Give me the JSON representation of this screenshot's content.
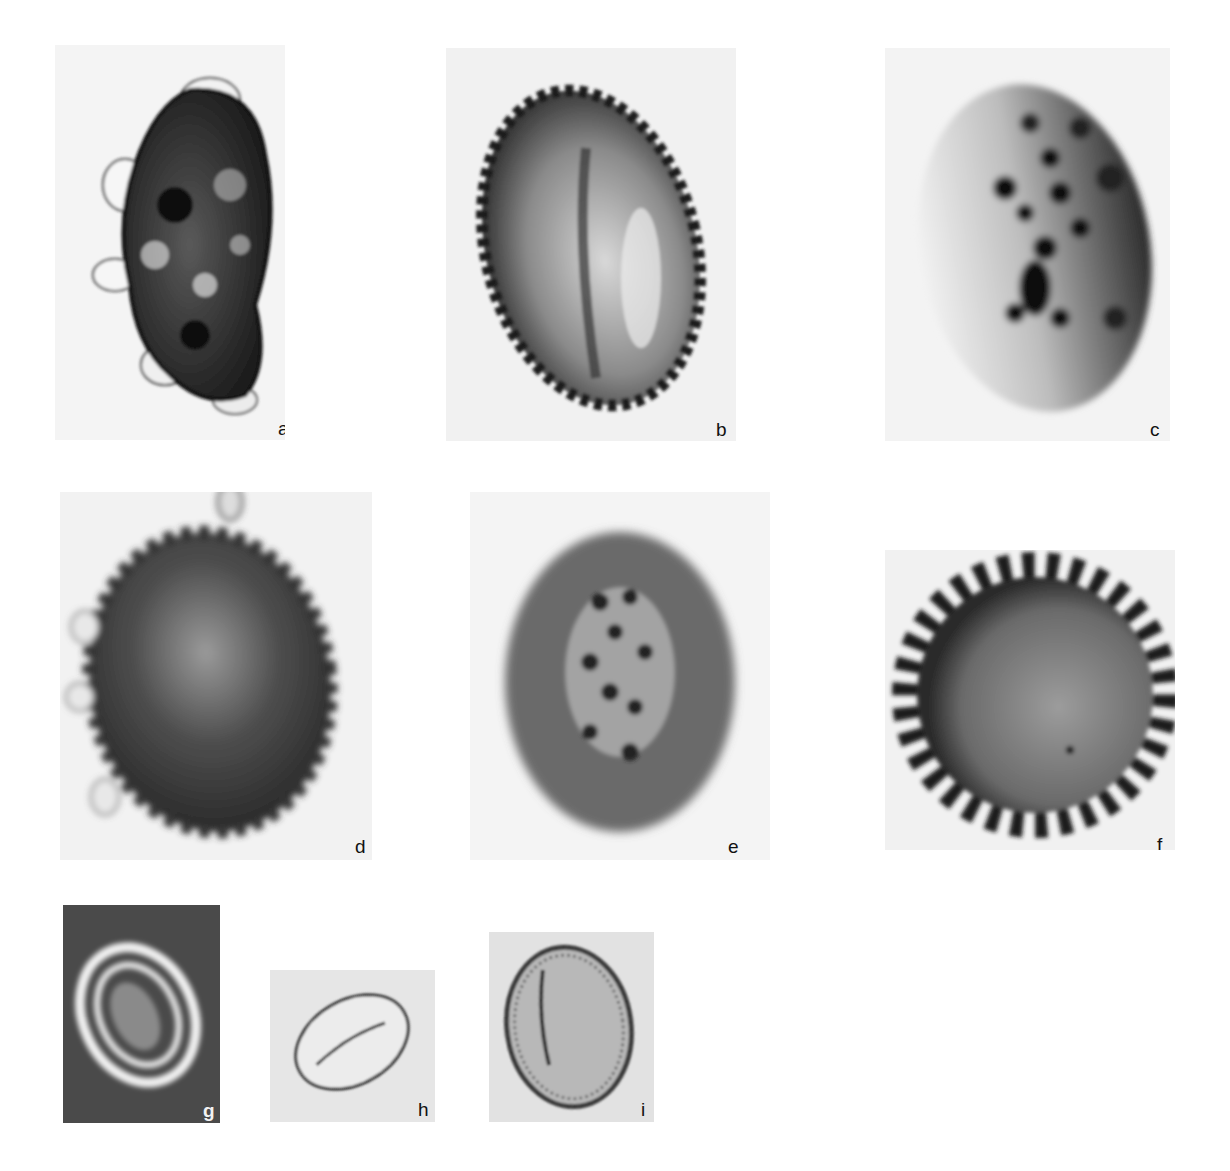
{
  "figure": {
    "type": "micrograph plate",
    "panels": [
      {
        "id": "a",
        "label": "a",
        "description": "irregular kidney-shaped grain with dark mottled interior and translucent bubbly outer wall",
        "background": "#f4f4f4"
      },
      {
        "id": "b",
        "label": "b",
        "description": "oval grain with spiny echinate margin and central furrow",
        "background": "#f1f1f1"
      },
      {
        "id": "c",
        "label": "c",
        "description": "oval grain with dark verrucate spots, darker right margin, pale left side",
        "background": "#f3f3f3"
      },
      {
        "id": "d",
        "label": "d",
        "description": "dark oval grain with bubbly translucent projections around margin",
        "background": "#f2f2f2"
      },
      {
        "id": "e",
        "label": "e",
        "description": "diffuse oval grain with reticulate dark interior pattern",
        "background": "#f4f4f4"
      },
      {
        "id": "f",
        "label": "f",
        "description": "round grain with regular conical spines around margin",
        "background": "#f1f1f1"
      },
      {
        "id": "g",
        "label": "g",
        "description": "phase-contrast grain: bright concentric rings on dark background with textured inner body",
        "background": "#4a4a4a"
      },
      {
        "id": "h",
        "label": "h",
        "description": "small smooth elliptical grain with single oblique furrow",
        "background": "#e6e6e6"
      },
      {
        "id": "i",
        "label": "i",
        "description": "large oval grain with thick striated wall and one long furrow",
        "background": "#e2e2e2"
      }
    ]
  }
}
